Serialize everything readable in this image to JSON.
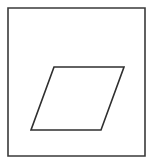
{
  "figure": {
    "background_color": "#ffffff",
    "width": 153,
    "height": 163,
    "frame": {
      "name": "outer-rectangle",
      "shape": "rectangle",
      "stroke_color": "#3a3a3a",
      "stroke_width": 1.6,
      "fill": "none",
      "x": 8,
      "y": 8,
      "width": 137,
      "height": 148,
      "points": "8,8 145,8 145,156 8,156"
    },
    "parallelogram": {
      "name": "inner-parallelogram",
      "shape": "parallelogram",
      "stroke_color": "#2f2f2f",
      "stroke_width": 1.6,
      "fill": "none",
      "points": "54,67 124,67 101,130 31,130",
      "vertices": [
        {
          "label": "top-left",
          "x": 54,
          "y": 67
        },
        {
          "label": "top-right",
          "x": 124,
          "y": 67
        },
        {
          "label": "bottom-right",
          "x": 101,
          "y": 130
        },
        {
          "label": "bottom-left",
          "x": 31,
          "y": 130
        }
      ],
      "side_length_horizontal": 70,
      "vertical_height": 63,
      "horizontal_offset": -23
    }
  }
}
